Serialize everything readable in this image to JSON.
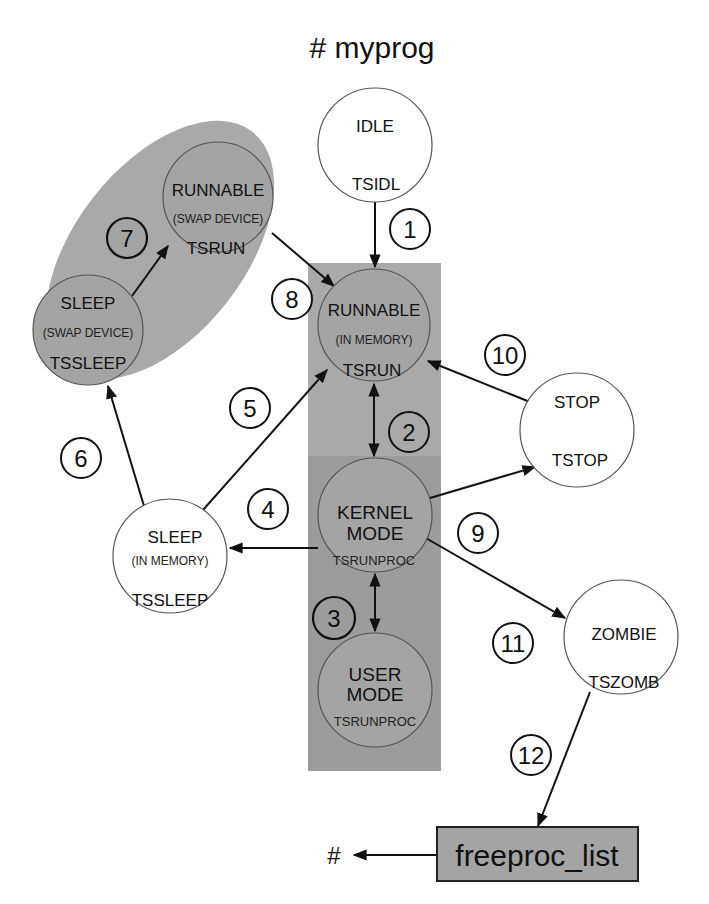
{
  "title": "# myprog",
  "colors": {
    "background": "#ffffff",
    "gray_region": "#a9a9a9",
    "gray_region_dark": "#9c9c9c",
    "state_gray_fill": "#a4a4a4",
    "state_white_fill": "#ffffff",
    "line": "#111111"
  },
  "states": {
    "idle": {
      "name": "IDLE",
      "code": "TSIDL"
    },
    "runnable_mem": {
      "name": "RUNNABLE",
      "sub": "(IN MEMORY)",
      "code": "TSRUN"
    },
    "kernel": {
      "name1": "KERNEL",
      "name2": "MODE",
      "code": "TSRUNPROC"
    },
    "user": {
      "name1": "USER",
      "name2": "MODE",
      "code": "TSRUNPROC"
    },
    "runnable_swap": {
      "name": "RUNNABLE",
      "sub": "(SWAP DEVICE)",
      "code": "TSRUN"
    },
    "sleep_swap": {
      "name": "SLEEP",
      "sub": "(SWAP DEVICE)",
      "code": "TSSLEEP"
    },
    "sleep_mem": {
      "name": "SLEEP",
      "sub": "(IN MEMORY)",
      "code": "TSSLEEP"
    },
    "stop": {
      "name": "STOP",
      "code": "TSTOP"
    },
    "zombie": {
      "name": "ZOMBIE",
      "code": "TSZOMB"
    }
  },
  "transitions": [
    {
      "n": "1",
      "from": "IDLE",
      "to": "RUNNABLE (IN MEMORY)"
    },
    {
      "n": "2",
      "from": "RUNNABLE (IN MEMORY)",
      "to": "KERNEL MODE",
      "bidirectional": true
    },
    {
      "n": "3",
      "from": "KERNEL MODE",
      "to": "USER MODE",
      "bidirectional": true
    },
    {
      "n": "4",
      "from": "KERNEL MODE",
      "to": "SLEEP (IN MEMORY)"
    },
    {
      "n": "5",
      "from": "SLEEP (IN MEMORY)",
      "to": "RUNNABLE (IN MEMORY)"
    },
    {
      "n": "6",
      "from": "SLEEP (IN MEMORY)",
      "to": "SLEEP (SWAP DEVICE)"
    },
    {
      "n": "7",
      "from": "SLEEP (SWAP DEVICE)",
      "to": "RUNNABLE (SWAP DEVICE)"
    },
    {
      "n": "8",
      "from": "RUNNABLE (SWAP DEVICE)",
      "to": "RUNNABLE (IN MEMORY)"
    },
    {
      "n": "9",
      "from": "KERNEL MODE",
      "to": "STOP"
    },
    {
      "n": "10",
      "from": "STOP",
      "to": "RUNNABLE (IN MEMORY)"
    },
    {
      "n": "11",
      "from": "KERNEL MODE",
      "to": "ZOMBIE"
    },
    {
      "n": "12",
      "from": "ZOMBIE",
      "to": "freeproc_list"
    }
  ],
  "labels": {
    "t1": "1",
    "t2": "2",
    "t3": "3",
    "t4": "4",
    "t5": "5",
    "t6": "6",
    "t7": "7",
    "t8": "8",
    "t9": "9",
    "t10": "10",
    "t11": "11",
    "t12": "12"
  },
  "freeproc": {
    "label": "freeproc_list",
    "target": "#"
  }
}
